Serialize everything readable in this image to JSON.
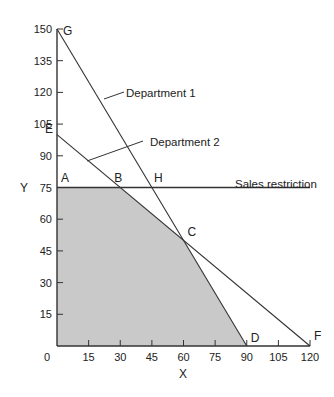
{
  "chart_data": {
    "type": "line",
    "title": "",
    "xlabel": "X",
    "ylabel": "Y",
    "xlim": [
      0,
      120
    ],
    "ylim": [
      0,
      150
    ],
    "grid": false,
    "x_ticks": [
      0,
      15,
      30,
      45,
      60,
      75,
      90,
      105,
      120
    ],
    "y_ticks": [
      15,
      30,
      45,
      60,
      75,
      90,
      105,
      120,
      135,
      150
    ],
    "origin_label": "0",
    "series": [
      {
        "name": "Department 1",
        "points": [
          [
            0,
            150
          ],
          [
            90,
            0
          ]
        ]
      },
      {
        "name": "Department 2",
        "points": [
          [
            0,
            100
          ],
          [
            120,
            0
          ]
        ]
      },
      {
        "name": "Sales restriction",
        "points": [
          [
            0,
            75
          ],
          [
            120,
            75
          ]
        ]
      }
    ],
    "feasible_region": {
      "fill": "#c9c9c9",
      "vertices": [
        [
          0,
          0
        ],
        [
          0,
          75
        ],
        [
          30,
          75
        ],
        [
          60,
          50
        ],
        [
          90,
          0
        ]
      ]
    },
    "points": [
      {
        "label": "A",
        "x": 0,
        "y": 75
      },
      {
        "label": "B",
        "x": 30,
        "y": 75
      },
      {
        "label": "H",
        "x": 45,
        "y": 75
      },
      {
        "label": "C",
        "x": 60,
        "y": 50
      },
      {
        "label": "D",
        "x": 90,
        "y": 0
      },
      {
        "label": "E",
        "x": 0,
        "y": 100
      },
      {
        "label": "F",
        "x": 120,
        "y": 0
      },
      {
        "label": "G",
        "x": 0,
        "y": 150
      }
    ],
    "annotations": [
      {
        "text": "Department 1",
        "points_to": "Department 1"
      },
      {
        "text": "Department 2",
        "points_to": "Department 2"
      },
      {
        "text": "Sales restriction",
        "points_to": "Sales restriction"
      }
    ]
  },
  "labels": {
    "x_axis": "X",
    "y_axis": "Y",
    "origin": "0",
    "x_ticks": [
      "15",
      "30",
      "45",
      "60",
      "75",
      "90",
      "105",
      "120"
    ],
    "y_ticks": [
      "15",
      "30",
      "45",
      "60",
      "75",
      "90",
      "105",
      "120",
      "135",
      "150"
    ],
    "points": {
      "A": "A",
      "B": "B",
      "C": "C",
      "D": "D",
      "E": "E",
      "F": "F",
      "G": "G",
      "H": "H"
    },
    "dept1": "Department 1",
    "dept2": "Department 2",
    "sales": "Sales restriction"
  }
}
